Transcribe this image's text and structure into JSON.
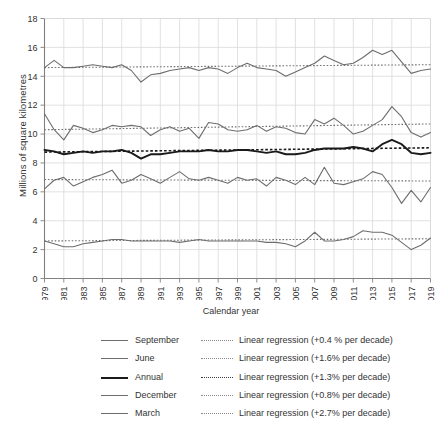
{
  "chart_data": {
    "type": "line",
    "title": "",
    "xlabel": "Calendar year",
    "ylabel": "Millions of square kilometres",
    "xlim": [
      1979,
      2019
    ],
    "ylim": [
      0,
      18
    ],
    "ytick_step": 2,
    "yticks": [
      0,
      2,
      4,
      6,
      8,
      10,
      12,
      14,
      16,
      18
    ],
    "xticks": [
      1979,
      1981,
      1983,
      1985,
      1987,
      1989,
      1991,
      1993,
      1995,
      1997,
      1999,
      2001,
      2003,
      2005,
      2007,
      2009,
      2011,
      2013,
      2015,
      2017,
      2019
    ],
    "grid": "both",
    "legend_position": "bottom",
    "x": [
      1979,
      1980,
      1981,
      1982,
      1983,
      1984,
      1985,
      1986,
      1987,
      1988,
      1989,
      1990,
      1991,
      1992,
      1993,
      1994,
      1995,
      1996,
      1997,
      1998,
      1999,
      2000,
      2001,
      2002,
      2003,
      2004,
      2005,
      2006,
      2007,
      2008,
      2009,
      2010,
      2011,
      2012,
      2013,
      2014,
      2015,
      2016,
      2017,
      2018,
      2019
    ],
    "series": [
      {
        "name": "September",
        "label": "September",
        "color": "#6d6d6d",
        "width": 1.1,
        "values": [
          14.6,
          15.1,
          14.6,
          14.6,
          14.7,
          14.8,
          14.7,
          14.6,
          14.8,
          14.4,
          13.6,
          14.1,
          14.2,
          14.4,
          14.5,
          14.6,
          14.4,
          14.6,
          14.5,
          14.2,
          14.6,
          14.9,
          14.6,
          14.5,
          14.4,
          14.0,
          14.3,
          14.6,
          14.9,
          15.4,
          15.1,
          14.8,
          14.9,
          15.3,
          15.8,
          15.5,
          15.8,
          15.0,
          14.2,
          14.4,
          14.5
        ]
      },
      {
        "name": "March",
        "label": "March",
        "color": "#6d6d6d",
        "width": 1.1,
        "values": [
          2.6,
          2.4,
          2.2,
          2.2,
          2.4,
          2.5,
          2.6,
          2.7,
          2.7,
          2.6,
          2.6,
          2.6,
          2.6,
          2.6,
          2.5,
          2.6,
          2.7,
          2.6,
          2.6,
          2.6,
          2.6,
          2.6,
          2.6,
          2.5,
          2.5,
          2.4,
          2.2,
          2.6,
          3.2,
          2.6,
          2.6,
          2.7,
          2.9,
          3.3,
          3.2,
          3.2,
          3.0,
          2.5,
          2.0,
          2.3,
          2.8
        ]
      },
      {
        "name": "Annual",
        "label": "Annual",
        "color": "#1a1a1a",
        "width": 1.9,
        "values": [
          8.9,
          8.8,
          8.6,
          8.7,
          8.8,
          8.7,
          8.8,
          8.8,
          8.9,
          8.7,
          8.3,
          8.6,
          8.6,
          8.7,
          8.8,
          8.8,
          8.8,
          8.9,
          8.8,
          8.8,
          8.9,
          8.9,
          8.8,
          8.7,
          8.8,
          8.6,
          8.6,
          8.7,
          8.9,
          9.0,
          9.0,
          9.0,
          9.1,
          9.0,
          8.8,
          9.3,
          9.6,
          9.3,
          8.7,
          8.6,
          8.7
        ]
      },
      {
        "name": "December",
        "label": "December",
        "color": "#6d6d6d",
        "width": 1.1,
        "values": [
          6.2,
          6.8,
          7.0,
          6.4,
          6.7,
          7.0,
          7.2,
          7.5,
          6.6,
          6.8,
          7.2,
          6.9,
          6.6,
          7.0,
          7.4,
          6.9,
          6.8,
          7.0,
          6.8,
          6.6,
          7.0,
          6.8,
          6.9,
          6.4,
          7.0,
          6.8,
          6.5,
          7.0,
          6.5,
          7.7,
          6.6,
          6.5,
          6.7,
          6.9,
          7.4,
          7.2,
          6.3,
          5.2,
          6.1,
          5.3,
          6.3
        ]
      },
      {
        "name": "June",
        "label": "June",
        "color": "#6d6d6d",
        "width": 1.1,
        "values": [
          11.4,
          10.3,
          9.6,
          10.6,
          10.4,
          10.1,
          10.3,
          10.6,
          10.5,
          10.6,
          10.5,
          9.9,
          10.3,
          10.5,
          10.2,
          10.4,
          9.7,
          10.8,
          10.7,
          10.3,
          10.2,
          10.3,
          10.6,
          10.2,
          10.5,
          10.4,
          10.1,
          10.0,
          11.0,
          10.7,
          11.1,
          10.6,
          10.0,
          10.2,
          10.6,
          11.0,
          11.9,
          11.2,
          10.1,
          9.8,
          10.1
        ]
      }
    ],
    "regressions": [
      {
        "for_series": "September",
        "label": "Linear regression (+0.4 % per decade)",
        "rate_per_decade": 0.4,
        "style": "dotted",
        "color": "#6f6f6f",
        "y_start": 14.6,
        "y_end": 14.8
      },
      {
        "for_series": "June",
        "label": "Linear regression (+1.6% per decade)",
        "rate_per_decade": 1.6,
        "style": "dotted",
        "color": "#6f6f6f",
        "y_start": 10.3,
        "y_end": 10.7
      },
      {
        "for_series": "Annual",
        "label": "Linear regression (+1.3% per decade)",
        "rate_per_decade": 1.3,
        "style": "dotted",
        "color": "#1a1a1a",
        "y_start": 8.75,
        "y_end": 9.05
      },
      {
        "for_series": "December",
        "label": "Linear regression (+0.8% per decade)",
        "rate_per_decade": 0.8,
        "style": "dotted",
        "color": "#6f6f6f",
        "y_start": 6.85,
        "y_end": 6.75
      },
      {
        "for_series": "March",
        "label": "Linear regression (+2.7% per decade)",
        "rate_per_decade": 2.7,
        "style": "dotted",
        "color": "#6f6f6f",
        "y_start": 2.6,
        "y_end": 2.75
      }
    ]
  },
  "legend": {
    "rows": [
      {
        "name": "September",
        "regression": "Linear regression (+0.4 % per decade)",
        "color": "#6d6d6d",
        "width": "1px"
      },
      {
        "name": "June",
        "regression": "Linear regression (+1.6% per decade)",
        "color": "#6d6d6d",
        "width": "1px"
      },
      {
        "name": "Annual",
        "regression": "Linear regression (+1.3% per decade)",
        "color": "#1a1a1a",
        "width": "2px"
      },
      {
        "name": "December",
        "regression": "Linear regression (+0.8% per decade)",
        "color": "#6d6d6d",
        "width": "1px"
      },
      {
        "name": "March",
        "regression": "Linear regression (+2.7% per decade)",
        "color": "#6d6d6d",
        "width": "1px"
      }
    ]
  },
  "style": {
    "grid_color": "#d9d9d9",
    "axis_color": "#808080",
    "text_color": "#333333",
    "background": "#ffffff"
  }
}
